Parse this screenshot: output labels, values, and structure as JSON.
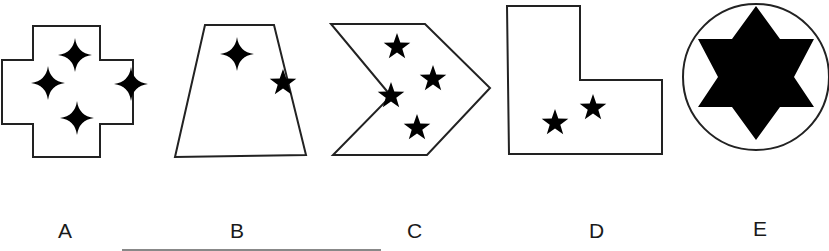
{
  "figure": {
    "options": [
      {
        "label": "A",
        "shape": "cross",
        "symbols": [
          {
            "type": "four-point-sparkle",
            "count": 4
          }
        ]
      },
      {
        "label": "B",
        "shape": "trapezoid",
        "symbols": [
          {
            "type": "four-point-sparkle",
            "count": 1
          },
          {
            "type": "five-point-star",
            "count": 1
          }
        ]
      },
      {
        "label": "C",
        "shape": "chevron",
        "symbols": [
          {
            "type": "five-point-star",
            "count": 4
          }
        ]
      },
      {
        "label": "D",
        "shape": "l-shape",
        "symbols": [
          {
            "type": "five-point-star",
            "count": 2
          }
        ]
      },
      {
        "label": "E",
        "shape": "circle",
        "symbols": [
          {
            "type": "six-point-star",
            "count": 1
          }
        ]
      }
    ],
    "colors": {
      "stroke": "#222222",
      "fill": "#000000",
      "background": "#ffffff"
    }
  }
}
